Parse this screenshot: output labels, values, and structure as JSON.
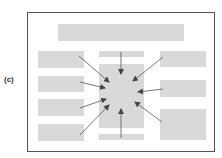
{
  "figure": {
    "panel_label": "(c)",
    "colors": {
      "frame_border": "#555555",
      "block_fill": "#d9d9d9",
      "arrow": "#555555",
      "background": "#ffffff"
    },
    "blocks": [
      {
        "name": "header-bar",
        "x": 58,
        "y": 24,
        "w": 126,
        "h": 17
      },
      {
        "name": "left-block-1",
        "x": 38,
        "y": 51,
        "w": 46,
        "h": 17
      },
      {
        "name": "left-block-2",
        "x": 38,
        "y": 76,
        "w": 46,
        "h": 16
      },
      {
        "name": "left-block-3",
        "x": 38,
        "y": 99,
        "w": 46,
        "h": 17
      },
      {
        "name": "left-block-4",
        "x": 38,
        "y": 124,
        "w": 46,
        "h": 17
      },
      {
        "name": "center-top-bar",
        "x": 99,
        "y": 51,
        "w": 45,
        "h": 6
      },
      {
        "name": "center-focal-block",
        "x": 99,
        "y": 64,
        "w": 45,
        "h": 64
      },
      {
        "name": "center-bottom-bar",
        "x": 99,
        "y": 134,
        "w": 45,
        "h": 6
      },
      {
        "name": "right-block-1",
        "x": 160,
        "y": 51,
        "w": 46,
        "h": 16
      },
      {
        "name": "right-block-2",
        "x": 160,
        "y": 80,
        "w": 46,
        "h": 17
      },
      {
        "name": "right-block-3",
        "x": 160,
        "y": 109,
        "w": 46,
        "h": 31
      }
    ],
    "arrows": [
      {
        "name": "arrow-from-left-1",
        "x1": 79,
        "y1": 56,
        "x2": 109,
        "y2": 82
      },
      {
        "name": "arrow-from-left-2",
        "x1": 80,
        "y1": 82,
        "x2": 105,
        "y2": 88
      },
      {
        "name": "arrow-from-left-3",
        "x1": 80,
        "y1": 108,
        "x2": 106,
        "y2": 99
      },
      {
        "name": "arrow-from-left-4",
        "x1": 80,
        "y1": 135,
        "x2": 109,
        "y2": 105
      },
      {
        "name": "arrow-from-top",
        "x1": 121,
        "y1": 52,
        "x2": 121,
        "y2": 74
      },
      {
        "name": "arrow-from-bottom",
        "x1": 121,
        "y1": 138,
        "x2": 121,
        "y2": 109
      },
      {
        "name": "arrow-from-right-1",
        "x1": 163,
        "y1": 57,
        "x2": 133,
        "y2": 81
      },
      {
        "name": "arrow-from-right-2",
        "x1": 163,
        "y1": 89,
        "x2": 138,
        "y2": 92
      },
      {
        "name": "arrow-from-right-3",
        "x1": 162,
        "y1": 122,
        "x2": 135,
        "y2": 102
      }
    ]
  }
}
